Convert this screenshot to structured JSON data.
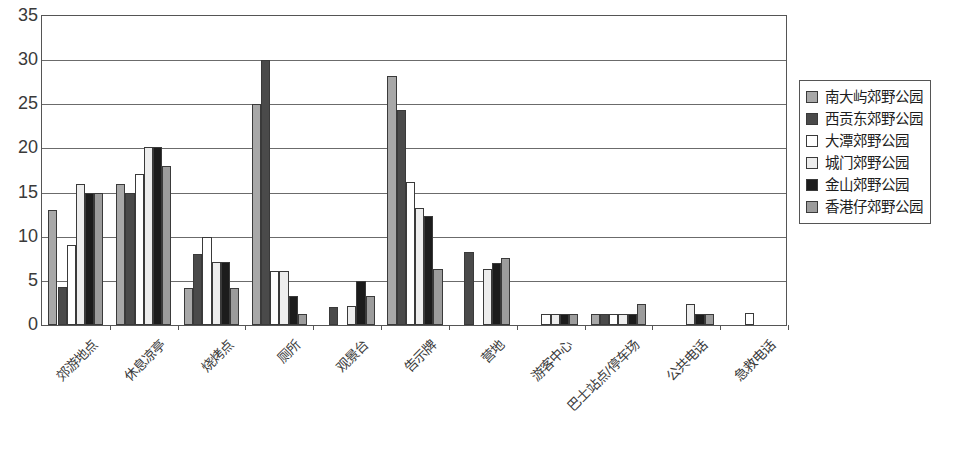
{
  "chart_data": {
    "type": "bar",
    "title": "",
    "xlabel": "",
    "ylabel": "",
    "ylim": [
      0,
      35
    ],
    "yticks": [
      "0",
      "5",
      "10",
      "15",
      "20",
      "25",
      "30",
      "35"
    ],
    "grid": true,
    "legend_position": "right",
    "categories": [
      "郊游地点",
      "休息凉亭",
      "烧烤点",
      "厕所",
      "观景台",
      "告示牌",
      "营地",
      "游客中心",
      "巴士站点/停车场",
      "公共电话",
      "急救电话"
    ],
    "series": [
      {
        "name": "南大屿郊野公园",
        "color": "#a8a8a8",
        "values": [
          13.0,
          16.0,
          4.2,
          25.0,
          0.0,
          28.2,
          0.0,
          0.0,
          1.3,
          0.0,
          0.0
        ]
      },
      {
        "name": "西贡东郊野公园",
        "color": "#4a4a4a",
        "values": [
          4.3,
          15.0,
          8.1,
          30.0,
          2.0,
          24.4,
          8.3,
          0.0,
          1.3,
          0.0,
          0.0
        ]
      },
      {
        "name": "大潭郊野公园",
        "color": "#ffffff",
        "values": [
          9.1,
          17.1,
          10.0,
          6.1,
          0.0,
          16.2,
          0.0,
          1.3,
          1.3,
          0.0,
          1.4
        ]
      },
      {
        "name": "城门郊野公园",
        "color": "#ededed",
        "values": [
          16.0,
          20.2,
          7.1,
          6.1,
          2.2,
          13.2,
          6.3,
          1.3,
          1.3,
          2.4,
          0.0
        ]
      },
      {
        "name": "金山郊野公园",
        "color": "#1c1c1c",
        "values": [
          15.0,
          20.2,
          7.1,
          3.3,
          5.0,
          12.4,
          7.0,
          1.3,
          1.3,
          1.3,
          0.0
        ]
      },
      {
        "name": "香港仔郊野公园",
        "color": "#9c9c9c",
        "values": [
          15.0,
          18.0,
          4.2,
          1.3,
          3.3,
          6.3,
          7.6,
          1.3,
          2.4,
          1.3,
          0.0
        ]
      }
    ]
  },
  "axes": {
    "y_max": 35,
    "y_step": 5
  }
}
